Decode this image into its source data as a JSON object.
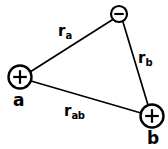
{
  "diagram": {
    "type": "electrostatics-charge-triangle",
    "background_color": "#ffffff",
    "stroke_color": "#000000",
    "nodes": [
      {
        "id": "a",
        "label": "a",
        "sign": "+",
        "sign_icon": "plus-icon",
        "cx": 20,
        "cy": 77,
        "r": 11.5,
        "stroke_width": 2.4
      },
      {
        "id": "c",
        "label": "",
        "sign": "−",
        "sign_icon": "minus-icon",
        "cx": 119,
        "cy": 14,
        "r": 8,
        "stroke_width": 2.2
      },
      {
        "id": "b",
        "label": "b",
        "sign": "+",
        "sign_icon": "plus-icon",
        "cx": 152,
        "cy": 116,
        "r": 11.5,
        "stroke_width": 2.4
      }
    ],
    "edges": [
      {
        "id": "ra",
        "label": "r",
        "subscript": "a",
        "from": "a",
        "to": "c",
        "x1": 30,
        "y1": 72,
        "x2": 112,
        "y2": 20,
        "stroke_width": 1.7
      },
      {
        "id": "rb",
        "label": "r",
        "subscript": "b",
        "from": "c",
        "to": "b",
        "x1": 123,
        "y1": 22,
        "x2": 148,
        "y2": 105,
        "stroke_width": 1.7
      },
      {
        "id": "rab",
        "label": "r",
        "subscript": "ab",
        "from": "a",
        "to": "b",
        "x1": 31,
        "y1": 81,
        "x2": 141,
        "y2": 113,
        "stroke_width": 1.7
      }
    ]
  }
}
